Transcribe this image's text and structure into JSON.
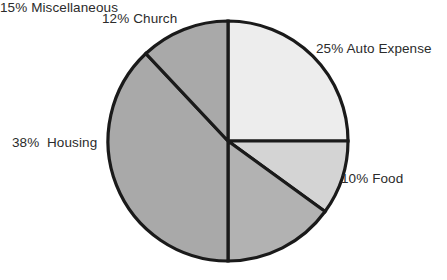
{
  "chart_data": {
    "type": "pie",
    "title": "",
    "subtitle": "",
    "xlabel": "",
    "ylabel": "",
    "legend_position": "none",
    "grid": false,
    "labels_inside": false,
    "start_angle_deg": 0,
    "direction": "clockwise",
    "categories": [
      "Auto Expense",
      "Food",
      "Miscellaneous",
      "Housing",
      "Church"
    ],
    "values": [
      25,
      10,
      15,
      38,
      12
    ],
    "units": "percent",
    "slices": [
      {
        "name": "auto-expense",
        "label": "25% Auto Expense",
        "percent_text": "25%",
        "category": "Auto Expense",
        "value": 25,
        "angle_deg": 90,
        "start_deg": 0,
        "end_deg": 90,
        "color": "#ededed"
      },
      {
        "name": "food",
        "label": "10% Food",
        "percent_text": "10%",
        "category": "Food",
        "value": 10,
        "angle_deg": 36,
        "start_deg": 90,
        "end_deg": 126,
        "color": "#d4d4d4"
      },
      {
        "name": "miscellaneous",
        "label": "15% Miscellaneous",
        "percent_text": "15%",
        "category": "Miscellaneous",
        "value": 15,
        "angle_deg": 54,
        "start_deg": 126,
        "end_deg": 180,
        "color": "#b2b2b2"
      },
      {
        "name": "housing",
        "label": "38%  Housing",
        "percent_text": "38%",
        "category": "Housing",
        "value": 38,
        "angle_deg": 136.8,
        "start_deg": 180,
        "end_deg": 316.8,
        "color": "#a9a9a9"
      },
      {
        "name": "church",
        "label": "12% Church",
        "percent_text": "12%",
        "category": "Church",
        "value": 12,
        "angle_deg": 43.2,
        "start_deg": 316.8,
        "end_deg": 360,
        "color": "#a9a9a9"
      }
    ],
    "geometry": {
      "center_x": 228,
      "center_y": 141,
      "radius": 120
    },
    "style": {
      "outline_color": "#1a1a1a",
      "outline_width": 3.2,
      "background": "#ffffff",
      "label_color": "#2b2b2b"
    }
  }
}
